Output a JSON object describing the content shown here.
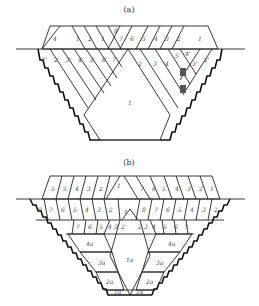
{
  "figure_a": {
    "caption": "(a)",
    "upper_labels": [
      "4",
      "1",
      "2",
      "1",
      "8",
      "7",
      "6",
      "5",
      "4",
      "3",
      "2",
      "1"
    ],
    "left_labels": [
      "1'",
      "2'",
      "3'",
      "4'",
      "5'",
      "6'",
      "7'"
    ],
    "right_labels": [
      "2",
      "3",
      "4",
      "5",
      "4'",
      "3'",
      "2'"
    ],
    "center_label": "1"
  },
  "figure_b": {
    "caption": "(b)",
    "upper_labels": [
      "5",
      "5",
      "4",
      "3",
      "2",
      "1",
      "7",
      "6",
      "5",
      "4",
      "3",
      "2",
      "1"
    ],
    "middle_labels": [
      "8",
      "7",
      "6",
      "5",
      "4",
      "3",
      "2",
      "1",
      "8",
      "7",
      "6",
      "5",
      "4",
      "3",
      "2"
    ],
    "lower_labels": [
      "7",
      "6",
      "5",
      "4",
      "3",
      "2",
      "2",
      "3",
      "4",
      "5",
      "6",
      "7"
    ],
    "side_labels": [
      "4a",
      "3a",
      "2a",
      "1a",
      "4a",
      "3a",
      "2a",
      "1a"
    ],
    "center_label": "1a"
  },
  "colors": {
    "line": "#222222",
    "background": "#ffffff"
  }
}
